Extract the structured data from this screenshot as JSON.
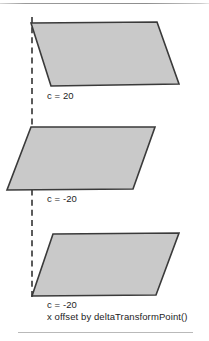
{
  "figure": {
    "width": 209,
    "height": 341,
    "background": "#ffffff",
    "rules": {
      "top_label": "top-divider-rule",
      "bottom_label": "bottom-divider-rule"
    },
    "axis": {
      "label": "dashed-reference-axis",
      "style": "dashed",
      "color": "#5b5b5b"
    },
    "shape_style": {
      "fill": "#c9c9c9",
      "stroke": "#3a3a3a"
    },
    "shapes": [
      {
        "name": "parallelogram-c-positive-20",
        "points": "31,23 157,22 179,84 51,86",
        "caption": "c = 20"
      },
      {
        "name": "parallelogram-c-negative-20",
        "points": "31,127 155,127 133,189 7,190",
        "caption": "c = -20"
      },
      {
        "name": "parallelogram-c-negative-20-offset",
        "points": "53,234 179,233 156,295 32,296",
        "caption": "c = -20",
        "caption_line2": "x offset by deltaTransformPoint()"
      }
    ]
  },
  "chart_data": {
    "type": "diagram",
    "items": [
      {
        "label": "c = 20",
        "skew_coefficient": 20,
        "note": ""
      },
      {
        "label": "c = -20",
        "skew_coefficient": -20,
        "note": ""
      },
      {
        "label": "c = -20",
        "skew_coefficient": -20,
        "note": "x offset by deltaTransformPoint()"
      }
    ]
  }
}
